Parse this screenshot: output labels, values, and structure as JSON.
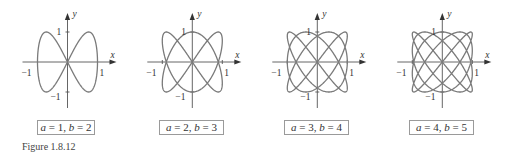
{
  "figure": {
    "caption": "Figure 1.8.12"
  },
  "chart_data": [
    {
      "type": "line",
      "title": "a = 1, b = 2",
      "equation": "x = sin(a t), y = sin(b t)",
      "a": 1,
      "b": 2,
      "xlabel": "x",
      "ylabel": "y",
      "xticks": [
        "-1",
        "1"
      ],
      "yticks": [
        "1",
        "-1"
      ],
      "xlim": [
        -1.5,
        1.5
      ],
      "ylim": [
        -1.5,
        1.5
      ],
      "grid": false
    },
    {
      "type": "line",
      "title": "a = 2, b = 3",
      "equation": "x = sin(a t), y = sin(b t)",
      "a": 2,
      "b": 3,
      "xlabel": "x",
      "ylabel": "y",
      "xticks": [
        "-1",
        "1"
      ],
      "yticks": [
        "1",
        "-1"
      ],
      "xlim": [
        -1.5,
        1.5
      ],
      "ylim": [
        -1.5,
        1.5
      ],
      "grid": false
    },
    {
      "type": "line",
      "title": "a = 3, b = 4",
      "equation": "x = sin(a t), y = sin(b t)",
      "a": 3,
      "b": 4,
      "xlabel": "x",
      "ylabel": "y",
      "xticks": [
        "-1",
        "1"
      ],
      "yticks": [
        "1",
        "-1"
      ],
      "xlim": [
        -1.5,
        1.5
      ],
      "ylim": [
        -1.5,
        1.5
      ],
      "grid": false
    },
    {
      "type": "line",
      "title": "a = 4, b = 5",
      "equation": "x = sin(a t), y = sin(b t)",
      "a": 4,
      "b": 5,
      "xlabel": "x",
      "ylabel": "y",
      "xticks": [
        "-1",
        "1"
      ],
      "yticks": [
        "1",
        "-1"
      ],
      "xlim": [
        -1.5,
        1.5
      ],
      "ylim": [
        -1.5,
        1.5
      ],
      "grid": false
    }
  ],
  "panels": [
    {
      "a_label": "a",
      "a_value": "1",
      "b_label": "b",
      "b_value": "2"
    },
    {
      "a_label": "a",
      "a_value": "2",
      "b_label": "b",
      "b_value": "3"
    },
    {
      "a_label": "a",
      "a_value": "3",
      "b_label": "b",
      "b_value": "4"
    },
    {
      "a_label": "a",
      "a_value": "4",
      "b_label": "b",
      "b_value": "5"
    }
  ],
  "colors": {
    "curve": "#7a7a7a",
    "axis": "#555555",
    "box_border": "#9a9a9a"
  }
}
